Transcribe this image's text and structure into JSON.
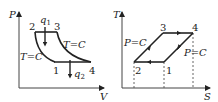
{
  "diagrams": [
    {
      "id": "pv",
      "x_axis": "V",
      "y_axis": "P",
      "points": [
        {
          "label": "1",
          "x": 55,
          "y": 62
        },
        {
          "label": "2",
          "x": 35,
          "y": 32
        },
        {
          "label": "3",
          "x": 57,
          "y": 32
        },
        {
          "label": "4",
          "x": 91,
          "y": 62
        }
      ],
      "heat_in": {
        "label": "q",
        "sub": "1"
      },
      "heat_out": {
        "label": "q",
        "sub": "2"
      },
      "curve_labels": [
        "T=C",
        "T=C"
      ]
    },
    {
      "id": "ts",
      "x_axis": "S",
      "y_axis": "T",
      "points": [
        {
          "label": "1",
          "x": 164,
          "y": 62
        },
        {
          "label": "2",
          "x": 134,
          "y": 62
        },
        {
          "label": "3",
          "x": 163,
          "y": 33
        },
        {
          "label": "4",
          "x": 193,
          "y": 33
        }
      ],
      "curve_labels": [
        "P=C",
        "P=C"
      ]
    }
  ],
  "labels": {
    "pv_y": "P",
    "pv_x": "V",
    "pv_p1": "1",
    "pv_p2": "2",
    "pv_p3": "3",
    "pv_p4": "4",
    "pv_q1": "q",
    "pv_q1_sub": "1",
    "pv_q2": "q",
    "pv_q2_sub": "2",
    "pv_tc_right": "T=C",
    "pv_tc_left": "T=C",
    "ts_y": "T",
    "ts_x": "S",
    "ts_p1": "1",
    "ts_p2": "2",
    "ts_p3": "3",
    "ts_p4": "4",
    "ts_pc_left": "P=C",
    "ts_pc_right": "P=C"
  }
}
